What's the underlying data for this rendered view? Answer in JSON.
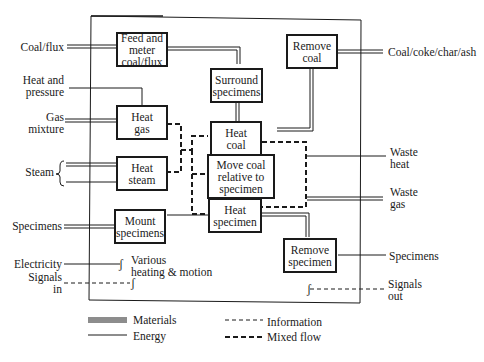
{
  "boxes": {
    "feed": "Feed and\nmeter\ncoal/flux",
    "remove_coal": "Remove\ncoal",
    "surround": "Surround\nspecimens",
    "heat_gas": "Heat\ngas",
    "heat_coal": "Heat\ncoal",
    "heat_steam": "Heat\nsteam",
    "move_coal": "Move coal\nrelative to\nspecimen",
    "heat_specimen": "Heat\nspecimen",
    "mount": "Mount\nspecimens",
    "remove_specimen": "Remove\nspecimen"
  },
  "inputs": {
    "coal_flux": "Coal/flux",
    "heat_pressure": "Heat and\npressure",
    "gas_mixture": "Gas\nmixture",
    "steam": "Steam",
    "specimens": "Specimens",
    "electricity": "Electricity",
    "signals_in": "Signals\nin"
  },
  "outputs": {
    "coal_products": "Coal/coke/char/ash",
    "waste_heat": "Waste\nheat",
    "waste_gas": "Waste\ngas",
    "specimens": "Specimens",
    "signals_out": "Signals\nout"
  },
  "notes": {
    "various": "Various\nheating & motion"
  },
  "legend": {
    "materials": "Materials",
    "energy": "Energy",
    "information": "Information",
    "mixed_flow": "Mixed flow"
  }
}
